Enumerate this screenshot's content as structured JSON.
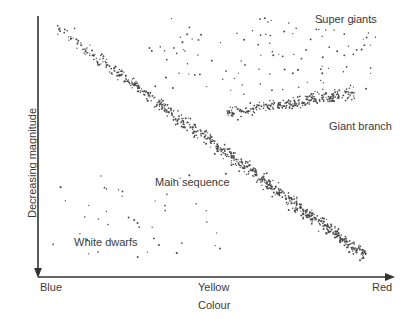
{
  "figure": {
    "background_color": "#ffffff",
    "point_color": "#4a4a4a",
    "axis_color": "#333333",
    "text_color": "#3b3b3b"
  },
  "axes": {
    "x_title": "Colour",
    "y_title": "Decreasing magnitude",
    "x_ticks": [
      {
        "label": "Blue"
      },
      {
        "label": "Yellow"
      },
      {
        "label": "Red"
      }
    ]
  },
  "annotations": [
    {
      "label": "Super giants"
    },
    {
      "label": "Giant branch"
    },
    {
      "label": "Main sequence"
    },
    {
      "label": "White dwarfs"
    }
  ],
  "chart_data": {
    "type": "scatter",
    "title": "",
    "xlabel": "Colour",
    "ylabel": "Decreasing magnitude",
    "xlim": [
      0,
      1
    ],
    "ylim": [
      0,
      1
    ],
    "grid": false,
    "legend": "none",
    "x_tick_labels": [
      "Blue",
      "Yellow",
      "Red"
    ],
    "x_tick_positions": [
      0.0,
      0.5,
      1.0
    ],
    "y_axis_direction": "decreasing-downward",
    "annotations": [
      {
        "text": "Super giants",
        "x": 0.79,
        "y": 0.96
      },
      {
        "text": "Giant branch",
        "x": 0.83,
        "y": 0.6
      },
      {
        "text": "Main sequence",
        "x": 0.35,
        "y": 0.4
      },
      {
        "text": "White dwarfs",
        "x": 0.12,
        "y": 0.19
      }
    ],
    "series": [
      {
        "name": "Main sequence",
        "n_points": 760,
        "shape": "diagonal-band",
        "start": [
          0.04,
          0.97
        ],
        "end": [
          0.95,
          0.05
        ],
        "band_width": 0.055,
        "density": "high"
      },
      {
        "name": "Giant branch",
        "n_points": 260,
        "shape": "horizontal-band",
        "start": [
          0.55,
          0.62
        ],
        "end": [
          0.92,
          0.7
        ],
        "band_width": 0.055,
        "density": "medium"
      },
      {
        "name": "Super giants",
        "n_points": 110,
        "shape": "diffuse-cloud",
        "x_range": [
          0.3,
          0.98
        ],
        "y_range": [
          0.7,
          1.0
        ],
        "density": "low"
      },
      {
        "name": "White dwarfs",
        "n_points": 45,
        "shape": "diffuse-cloud",
        "x_range": [
          0.04,
          0.55
        ],
        "y_range": [
          0.05,
          0.38
        ],
        "density": "very-low"
      }
    ]
  }
}
